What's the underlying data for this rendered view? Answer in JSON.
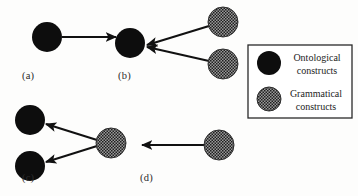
{
  "figure": {
    "background_color": "#fdfdfc",
    "node_colors": {
      "ontological": "#0d0d0d",
      "grammatical_base": "#8a8a8a",
      "grammatical_dot": "#1a1a1a",
      "arrow": "#111111",
      "legend_border": "#2a2a2a"
    },
    "panels": [
      {
        "id": "a",
        "label": "(a)",
        "label_x": 22,
        "label_y": 70,
        "nodes": [
          {
            "name": "ontological-node",
            "kind": "ontological",
            "cx": 47,
            "cy": 37,
            "r": 15
          }
        ],
        "arrows": [
          {
            "name": "arrow-right",
            "x1": 62,
            "y1": 37,
            "x2": 116,
            "y2": 37
          }
        ]
      },
      {
        "id": "b",
        "label": "(b)",
        "label_x": 118,
        "label_y": 70,
        "nodes": [
          {
            "name": "ontological-node",
            "kind": "ontological",
            "cx": 130,
            "cy": 43,
            "r": 15
          },
          {
            "name": "grammatical-node-upper",
            "kind": "grammatical",
            "cx": 223,
            "cy": 22,
            "r": 15
          },
          {
            "name": "grammatical-node-lower",
            "kind": "grammatical",
            "cx": 223,
            "cy": 64,
            "r": 15
          }
        ],
        "arrows": [
          {
            "name": "arrow-upper-to-ontological",
            "x1": 209,
            "y1": 26,
            "x2": 147,
            "y2": 45
          },
          {
            "name": "arrow-lower-to-ontological",
            "x1": 209,
            "y1": 61,
            "x2": 147,
            "y2": 47
          }
        ]
      },
      {
        "id": "c",
        "label": "(c)",
        "label_x": 22,
        "label_y": 172,
        "nodes": [
          {
            "name": "ontological-node-upper",
            "kind": "ontological",
            "cx": 30,
            "cy": 120,
            "r": 15
          },
          {
            "name": "ontological-node-lower",
            "kind": "ontological",
            "cx": 30,
            "cy": 166,
            "r": 15
          },
          {
            "name": "grammatical-node",
            "kind": "grammatical",
            "cx": 111,
            "cy": 143,
            "r": 15
          }
        ],
        "arrows": [
          {
            "name": "arrow-to-upper-ontological",
            "x1": 97,
            "y1": 140,
            "x2": 46,
            "y2": 124
          },
          {
            "name": "arrow-to-lower-ontological",
            "x1": 97,
            "y1": 146,
            "x2": 46,
            "y2": 162
          }
        ]
      },
      {
        "id": "d",
        "label": "(d)",
        "label_x": 140,
        "label_y": 172,
        "nodes": [
          {
            "name": "grammatical-node",
            "kind": "grammatical",
            "cx": 219,
            "cy": 145,
            "r": 15
          }
        ],
        "arrows": [
          {
            "name": "arrow-left",
            "x1": 204,
            "y1": 145,
            "x2": 142,
            "y2": 145
          }
        ]
      }
    ],
    "legend": {
      "name": "legend-box",
      "x": 248,
      "y": 45,
      "width": 104,
      "height": 73,
      "entries": [
        {
          "id": "ontological",
          "kind": "ontological",
          "swatch_cx": 269,
          "swatch_cy": 63,
          "swatch_r": 12,
          "line1": "Ontological",
          "line2": "constructs",
          "text_x": 286,
          "text_y": 52,
          "text_width": 62
        },
        {
          "id": "grammatical",
          "kind": "grammatical",
          "swatch_cx": 269,
          "swatch_cy": 99,
          "swatch_r": 12,
          "line1": "Grammatical",
          "line2": "constructs",
          "text_x": 284,
          "text_y": 87,
          "text_width": 66
        }
      ]
    }
  }
}
